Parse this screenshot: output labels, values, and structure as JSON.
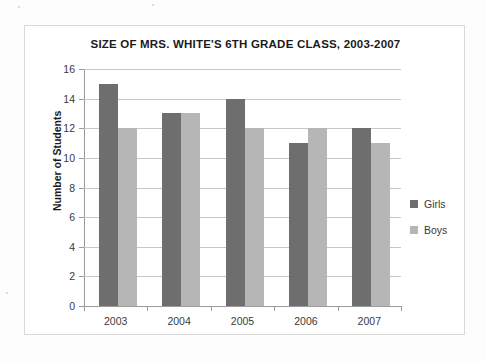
{
  "chart_data": {
    "type": "bar",
    "title": "SIZE OF MRS. WHITE'S 6TH GRADE CLASS, 2003-2007",
    "xlabel": "",
    "ylabel": "Number of Students",
    "categories": [
      "2003",
      "2004",
      "2005",
      "2006",
      "2007"
    ],
    "series": [
      {
        "name": "Girls",
        "color": "#6e6e6e",
        "values": [
          15,
          13,
          14,
          11,
          12
        ]
      },
      {
        "name": "Boys",
        "color": "#b6b6b6",
        "values": [
          12,
          13,
          12,
          12,
          11
        ]
      }
    ],
    "ylim": [
      0,
      16
    ],
    "ytick_step": 2,
    "yticks": [
      "0",
      "2",
      "4",
      "6",
      "8",
      "10",
      "12",
      "14",
      "16"
    ],
    "grid": true,
    "legend_position": "right"
  }
}
